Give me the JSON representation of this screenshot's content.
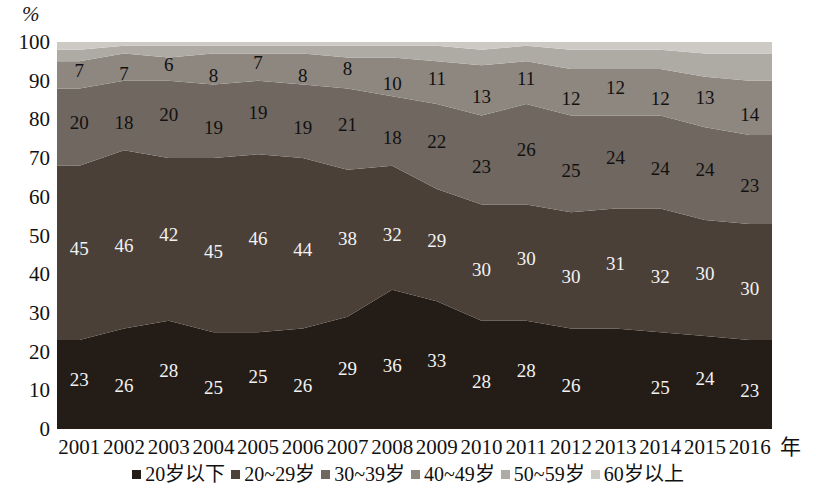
{
  "chart_data": {
    "type": "area",
    "title": "",
    "xlabel": "年",
    "ylabel": "%",
    "ylim": [
      0,
      100
    ],
    "ytick_step": 10,
    "yticks": [
      "100",
      "90",
      "80",
      "70",
      "60",
      "50",
      "40",
      "30",
      "20",
      "10",
      "0"
    ],
    "grid": false,
    "stacked": true,
    "stack_order_bottom_to_top": [
      "20岁以下",
      "20~29岁",
      "30~39岁",
      "40~49岁",
      "50~59岁",
      "60岁以上"
    ],
    "legend_position": "bottom",
    "categories": [
      "2001",
      "2002",
      "2003",
      "2004",
      "2005",
      "2006",
      "2007",
      "2008",
      "2009",
      "2010",
      "2011",
      "2012",
      "2013",
      "2014",
      "2015",
      "2016"
    ],
    "series": [
      {
        "name": "20岁以下",
        "color": "#241c16",
        "values": [
          23,
          26,
          28,
          25,
          25,
          26,
          29,
          36,
          33,
          28,
          28,
          26,
          26,
          25,
          24,
          23
        ],
        "labels": [
          "23",
          "26",
          "28",
          "25",
          "25",
          "26",
          "29",
          "36",
          "33",
          "28",
          "28",
          "26",
          "",
          "25",
          "24",
          "23"
        ]
      },
      {
        "name": "20~29岁",
        "color": "#4a4038",
        "values": [
          45,
          46,
          42,
          45,
          46,
          44,
          38,
          32,
          29,
          30,
          30,
          30,
          31,
          32,
          30,
          30
        ],
        "labels": [
          "45",
          "46",
          "42",
          "45",
          "46",
          "44",
          "38",
          "32",
          "29",
          "30",
          "30",
          "30",
          "31",
          "32",
          "30",
          "30"
        ]
      },
      {
        "name": "30~39岁",
        "color": "#6f6760",
        "values": [
          20,
          18,
          20,
          19,
          19,
          19,
          21,
          18,
          22,
          23,
          26,
          25,
          24,
          24,
          24,
          23
        ],
        "labels": [
          "20",
          "18",
          "20",
          "19",
          "19",
          "19",
          "21",
          "18",
          "22",
          "23",
          "26",
          "25",
          "24",
          "24",
          "24",
          "23"
        ]
      },
      {
        "name": "40~49岁",
        "color": "#8d8780",
        "values": [
          7,
          7,
          6,
          8,
          7,
          8,
          8,
          10,
          11,
          13,
          11,
          12,
          12,
          12,
          13,
          14
        ],
        "labels": [
          "7",
          "7",
          "6",
          "8",
          "7",
          "8",
          "8",
          "10",
          "11",
          "13",
          "11",
          "12",
          "12",
          "12",
          "13",
          "14"
        ]
      },
      {
        "name": "50~59岁",
        "color": "#aeaaa4",
        "values": [
          3,
          2,
          3,
          2,
          2,
          2,
          3,
          3,
          4,
          4,
          4,
          5,
          5,
          5,
          6,
          7
        ],
        "labels": [
          "",
          "",
          "",
          "",
          "",
          "",
          "",
          "",
          "",
          "",
          "",
          "",
          "",
          "",
          "",
          ""
        ]
      },
      {
        "name": "60岁以上",
        "color": "#cdcac5",
        "values": [
          2,
          1,
          1,
          1,
          1,
          1,
          1,
          1,
          1,
          2,
          1,
          2,
          2,
          2,
          3,
          3
        ],
        "labels": [
          "",
          "",
          "",
          "",
          "",
          "",
          "",
          "",
          "",
          "",
          "",
          "",
          "",
          "",
          "",
          ""
        ]
      }
    ]
  },
  "axis": {
    "y_unit": "%",
    "x_unit": "年"
  },
  "legend": {
    "items": [
      {
        "label": "20岁以下",
        "color": "#241c16"
      },
      {
        "label": "20~29岁",
        "color": "#4a4038"
      },
      {
        "label": "30~39岁",
        "color": "#6f6760"
      },
      {
        "label": "40~49岁",
        "color": "#8d8780"
      },
      {
        "label": "50~59岁",
        "color": "#aeaaa4"
      },
      {
        "label": "60岁以上",
        "color": "#cdcac5"
      }
    ]
  }
}
